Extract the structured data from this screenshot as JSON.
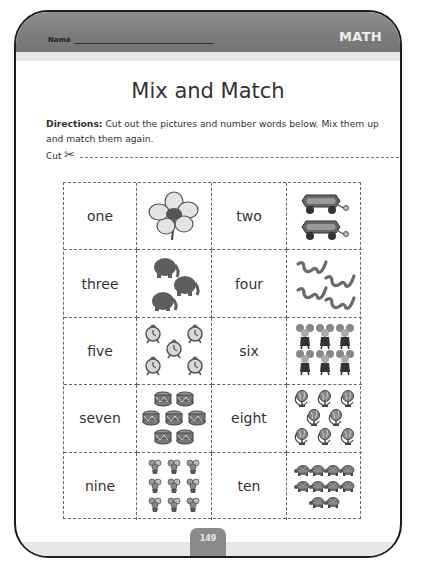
{
  "header": {
    "name_label": "Name",
    "subject": "MATH"
  },
  "title": "Mix and Match",
  "directions": {
    "label": "Directions:",
    "text": " Cut out the pictures and number words below. Mix them up and match them again."
  },
  "cut": {
    "label": "Cut",
    "icon": "✂"
  },
  "grid": {
    "rows": [
      [
        {
          "word": "one",
          "picture": "flower",
          "count": 1
        },
        {
          "word": "two",
          "picture": "wagon",
          "count": 2
        }
      ],
      [
        {
          "word": "three",
          "picture": "elephant",
          "count": 3
        },
        {
          "word": "four",
          "picture": "snake",
          "count": 4
        }
      ],
      [
        {
          "word": "five",
          "picture": "alarm-clock",
          "count": 5
        },
        {
          "word": "six",
          "picture": "mouse",
          "count": 6
        }
      ],
      [
        {
          "word": "seven",
          "picture": "drum",
          "count": 7
        },
        {
          "word": "eight",
          "picture": "globe",
          "count": 8
        }
      ],
      [
        {
          "word": "nine",
          "picture": "flower-pot",
          "count": 9
        },
        {
          "word": "ten",
          "picture": "turtle",
          "count": 10
        }
      ]
    ]
  },
  "footer": {
    "page_number": "149"
  },
  "colors": {
    "header_band": "#7c7c7c",
    "header_sub": "#e6e6e6",
    "page_tab": "#8a8a8a",
    "frame": "#1e1e1e",
    "text": "#333333"
  }
}
